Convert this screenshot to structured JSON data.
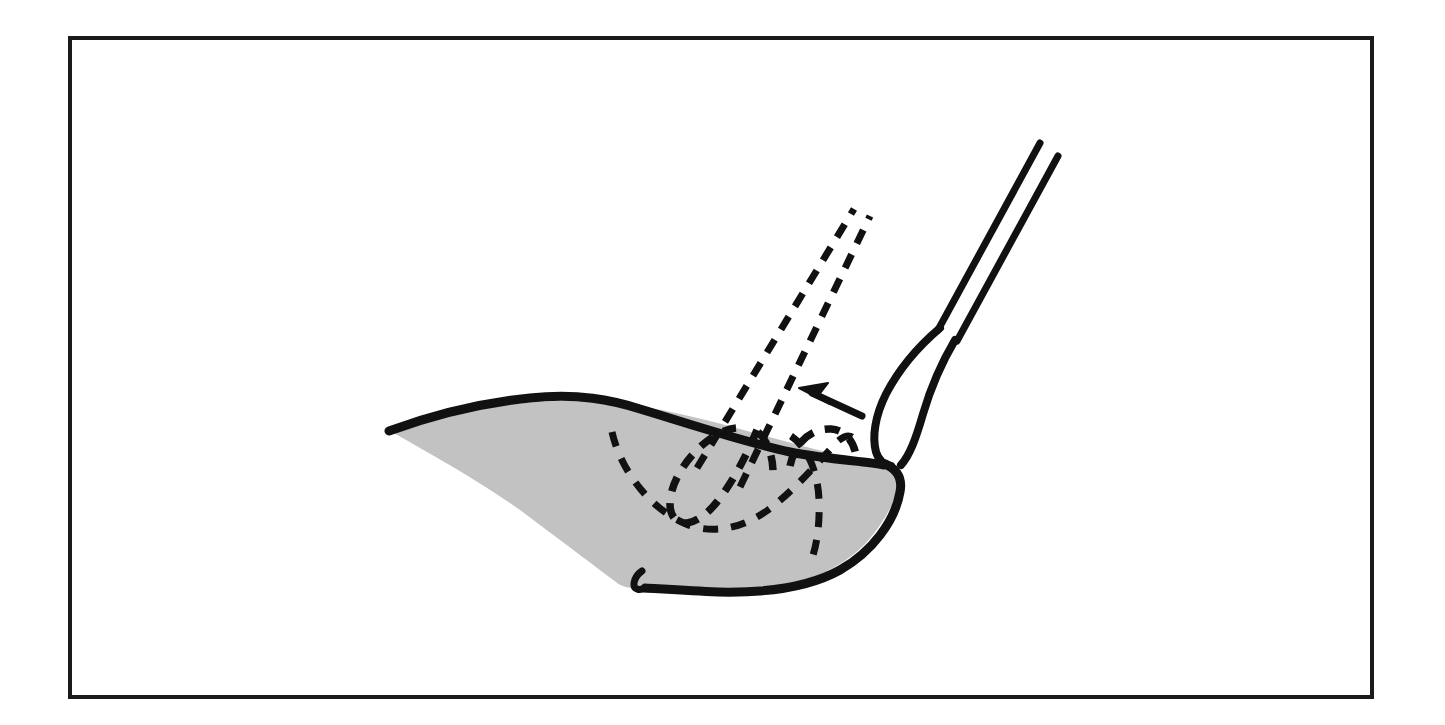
{
  "figure": {
    "title": "Surgical instrument repositioning diagram",
    "caption": "",
    "canvas": {
      "width": 1445,
      "height": 725
    },
    "colors": {
      "background": "#ffffff",
      "frame_stroke": "#1a1a1a",
      "organ_fill": "#c2c2c2",
      "ink": "#111111"
    }
  },
  "frame": {
    "label": "figure-border",
    "x": 70,
    "y": 38,
    "width": 1302,
    "height": 659,
    "stroke_width": 4
  },
  "elements": {
    "organ": {
      "label": "shaded-organ-body",
      "fill": "#c2c2c2",
      "outline_stroke_width": 9,
      "left_tip": [
        388,
        430
      ],
      "right_tip": [
        901,
        470
      ],
      "bottom_notch": [
        637,
        590
      ]
    },
    "instrument_final": {
      "label": "instrument-final-position",
      "style": "solid",
      "tip_upper": [
        1040,
        143
      ],
      "tip_lower": [
        1058,
        156
      ],
      "bulb_center": [
        890,
        420
      ],
      "shaft_count": 2
    },
    "instrument_ghost": {
      "label": "instrument-previous-position",
      "style": "dashed",
      "tip_upper": [
        855,
        208
      ],
      "tip_lower": [
        871,
        216
      ],
      "bulb_center": [
        737,
        455
      ],
      "shaft_count": 2
    },
    "ghost_tract": {
      "label": "dashed-anatomical-tract",
      "style": "dashed",
      "start": [
        613,
        432
      ],
      "end": [
        851,
        437
      ]
    },
    "ghost_loop_right": {
      "label": "dashed-secondary-loop",
      "style": "dashed",
      "start": [
        793,
        437
      ],
      "end": [
        812,
        560
      ]
    },
    "motion_arrow": {
      "label": "motion-direction-arrow",
      "direction": "up-left",
      "tail": [
        862,
        415
      ],
      "head": [
        800,
        389
      ]
    }
  },
  "legend_text": {
    "solid": "",
    "dashed": ""
  }
}
